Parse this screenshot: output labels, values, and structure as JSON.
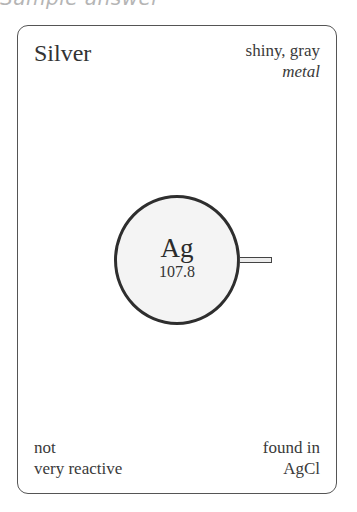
{
  "header": {
    "cut_text": "Sample answer"
  },
  "card": {
    "element_name": "Silver",
    "properties": {
      "line1": "shiny, gray",
      "line2": "metal"
    },
    "atom": {
      "symbol": "Ag",
      "atomic_mass": "107.8",
      "bonds_shown": 1
    },
    "reactivity": {
      "line1": "not",
      "line2": "very reactive"
    },
    "found_in": {
      "line1": "found in",
      "line2": "AgCl"
    }
  },
  "colors": {
    "card_border": "#555555",
    "atom_border": "#2e2e2e",
    "atom_fill": "#f4f4f4",
    "text": "#333333",
    "header_text": "#b5b5b5"
  }
}
